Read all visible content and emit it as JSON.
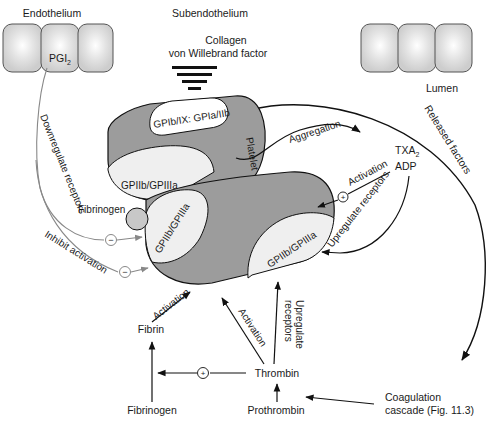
{
  "regions": {
    "endothelium": "Endothelium",
    "subendothelium": "Subendothelium",
    "lumen": "Lumen"
  },
  "endothelial_mediator": {
    "base": "PGI",
    "subscript": "2"
  },
  "subendothelial_components": {
    "line1": "Collagen",
    "line2": "von Willebrand factor"
  },
  "platelets": {
    "upper": {
      "label": "Platelet",
      "adhesion_receptor": "GPIb/IX: GPIa/IIb",
      "aggregation_receptor": "GPIIb/GPIIIa"
    },
    "lower": {
      "left_receptor": "GPIIb/GPIIIa",
      "right_receptor": "GPIIb/GPIIIa"
    },
    "bridge": "Fibrinogen"
  },
  "mediators": {
    "txa": {
      "base": "TXA",
      "subscript": "2"
    },
    "adp": "ADP",
    "thrombin": "Thrombin",
    "prothrombin": "Prothrombin",
    "fibrin": "Fibrin",
    "fibrinogen": "Fibrinogen",
    "cascade_line1": "Coagulation",
    "cascade_line2": "cascade (Fig. 11.3)"
  },
  "arrows": {
    "aggregation": "Aggregation",
    "activation_txa": "Activation",
    "upregulate_txa": "Upregulate receptors",
    "released_factors": "Released factors",
    "downregulate": "Downregulate receptors",
    "inhibit": "Inhibit activation",
    "activation_fibrin": "Activation",
    "activation_thrombin": "Activation",
    "upregulate_thrombin_1": "Upregulate",
    "upregulate_thrombin_2": "receptors"
  },
  "symbols": {
    "plus": "+",
    "minus": "−"
  },
  "colors": {
    "cell_fill": "#cfcfcf",
    "cell_highlight": "#ffffff",
    "platelet_fill": "#9c9c9c",
    "receptor_fill": "#efefef",
    "fibrinogen_fill": "#c8c8c8",
    "line": "#111111",
    "inhibit_line": "#888888"
  }
}
